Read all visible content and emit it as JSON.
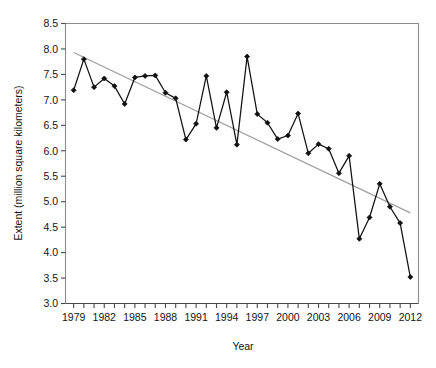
{
  "chart_data": {
    "type": "line",
    "title": "",
    "xlabel": "Year",
    "ylabel": "Extent (million square kilometers)",
    "xlim": [
      1978.2,
      2012.8
    ],
    "ylim": [
      3.0,
      8.5
    ],
    "grid": false,
    "legend": "none",
    "x_tick_labels": [
      "1979",
      "1982",
      "1985",
      "1988",
      "1991",
      "1994",
      "1997",
      "2000",
      "2003",
      "2006",
      "2009",
      "2012"
    ],
    "x_tick_values": [
      1979,
      1982,
      1985,
      1988,
      1991,
      1994,
      1997,
      2000,
      2003,
      2006,
      2009,
      2012
    ],
    "x_minor_ticks": [
      1979,
      1980,
      1981,
      1982,
      1983,
      1984,
      1985,
      1986,
      1987,
      1988,
      1989,
      1990,
      1991,
      1992,
      1993,
      1994,
      1995,
      1996,
      1997,
      1998,
      1999,
      2000,
      2001,
      2002,
      2003,
      2004,
      2005,
      2006,
      2007,
      2008,
      2009,
      2010,
      2011,
      2012
    ],
    "y_tick_labels": [
      "3.0",
      "3.5",
      "4.0",
      "4.5",
      "5.0",
      "5.5",
      "6.0",
      "6.5",
      "7.0",
      "7.5",
      "8.0",
      "8.5"
    ],
    "y_tick_values": [
      3.0,
      3.5,
      4.0,
      4.5,
      5.0,
      5.5,
      6.0,
      6.5,
      7.0,
      7.5,
      8.0,
      8.5
    ],
    "x": [
      1979,
      1980,
      1981,
      1982,
      1983,
      1984,
      1985,
      1986,
      1987,
      1988,
      1989,
      1990,
      1991,
      1992,
      1993,
      1994,
      1995,
      1996,
      1997,
      1998,
      1999,
      2000,
      2001,
      2002,
      2003,
      2004,
      2005,
      2006,
      2007,
      2008,
      2009,
      2010,
      2011,
      2012
    ],
    "series": [
      {
        "name": "Sea ice extent",
        "marker": "filled-diamond",
        "color": "#111111",
        "values": [
          7.19,
          7.8,
          7.25,
          7.42,
          7.27,
          6.92,
          7.44,
          7.47,
          7.48,
          7.14,
          7.03,
          6.22,
          6.53,
          7.47,
          6.45,
          7.15,
          6.12,
          7.85,
          6.72,
          6.55,
          6.23,
          6.3,
          6.73,
          5.95,
          6.13,
          6.04,
          5.56,
          5.9,
          4.27,
          4.69,
          5.35,
          4.9,
          4.58,
          3.52
        ]
      }
    ],
    "trend_line": {
      "name": "linear trend",
      "color": "#a0a0a0",
      "x_start": 1979,
      "y_start": 7.93,
      "x_end": 2012,
      "y_end": 4.78
    }
  }
}
